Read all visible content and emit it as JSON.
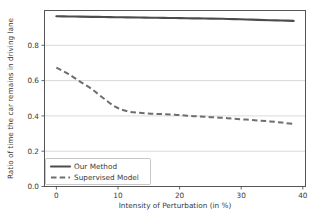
{
  "chart_data": {
    "type": "line",
    "title": "",
    "xlabel": "Intensity of Perturbation (in %)",
    "ylabel": "Ratio of time the car remains in driving lane",
    "xlim": [
      -2,
      42
    ],
    "ylim": [
      0.0,
      1.0
    ],
    "xticks": [
      0,
      10,
      20,
      30,
      40
    ],
    "xticklabels": [
      "0",
      "10",
      "20",
      "30",
      "40"
    ],
    "yticks": [
      0.0,
      0.2,
      0.4,
      0.6,
      0.8
    ],
    "yticklabels": [
      "0.0",
      "0.2",
      "0.4",
      "0.6",
      "0.8"
    ],
    "grid": "horizontal",
    "legend_position": "lower left",
    "x": [
      0,
      2,
      4,
      6,
      8,
      10,
      12,
      14,
      16,
      18,
      20,
      22,
      24,
      26,
      28,
      30,
      32,
      34,
      36,
      38,
      40
    ],
    "series": [
      {
        "name": "Our Method",
        "style": "solid",
        "color": "#4c4c4c",
        "values": [
          0.967,
          0.966,
          0.965,
          0.964,
          0.963,
          0.962,
          0.961,
          0.96,
          0.959,
          0.958,
          0.957,
          0.956,
          0.955,
          0.954,
          0.953,
          0.951,
          0.949,
          0.947,
          0.945,
          0.943,
          0.941
        ]
      },
      {
        "name": "Supervised Model",
        "style": "dashed",
        "color": "#6e6e6e",
        "values": [
          0.676,
          0.64,
          0.596,
          0.553,
          0.5,
          0.452,
          0.427,
          0.419,
          0.414,
          0.411,
          0.408,
          0.402,
          0.398,
          0.394,
          0.39,
          0.385,
          0.38,
          0.375,
          0.37,
          0.363,
          0.355
        ]
      }
    ]
  },
  "legend": {
    "entries": [
      {
        "label": "Our Method"
      },
      {
        "label": "Supervised Model"
      }
    ]
  },
  "axes": {
    "xlabel": "Intensity of Perturbation (in %)",
    "ylabel": "Ratio of time the car remains in driving lane"
  }
}
